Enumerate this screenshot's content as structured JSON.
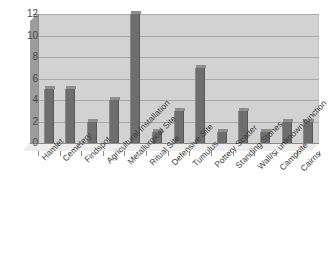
{
  "chart_data": {
    "type": "bar",
    "title": "",
    "subtitle": "",
    "xlabel": "",
    "ylabel": "",
    "ylim": [
      0,
      12
    ],
    "yticks": [
      0,
      2,
      4,
      6,
      8,
      10,
      12
    ],
    "grid": true,
    "legend": false,
    "legend_position": "none",
    "style": "3d-bar",
    "bar_color": "#6e6e6e",
    "plot_background": "#d2d2d2",
    "gridline_color": "#a9a9a9",
    "categories": [
      "Hamlet",
      "Cemetery",
      "Findspot",
      "Agricultural Installation",
      "Metallurgical Site",
      "Ritual Site",
      "Defensive Site",
      "Tumulus",
      "Pottery Scatter",
      "Standing Stones",
      "Wall/s; unknown function",
      "Campsite",
      "Cairns"
    ],
    "values": [
      5,
      5,
      2,
      4,
      12,
      1,
      3,
      7,
      1,
      3,
      1,
      2,
      2
    ],
    "series": [
      {
        "name": "",
        "values": [
          5,
          5,
          2,
          4,
          12,
          1,
          3,
          7,
          1,
          3,
          1,
          2,
          2
        ]
      }
    ]
  }
}
